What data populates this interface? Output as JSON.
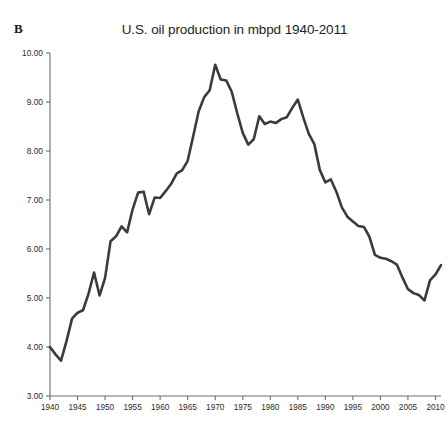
{
  "panel": {
    "label": "B"
  },
  "chart_data": {
    "type": "line",
    "title": "U.S. oil production in mbpd 1940-2011",
    "xlabel": "",
    "ylabel": "",
    "xlim": [
      1940,
      2011
    ],
    "ylim": [
      3.0,
      10.0
    ],
    "grid": false,
    "legend": "none",
    "line_color": "#3b3b3b",
    "axis_color": "#6e6e6e",
    "y_ticks": [
      "3.00",
      "4.00",
      "5.00",
      "6.00",
      "7.00",
      "8.00",
      "9.00",
      "10.00"
    ],
    "y_tick_values": [
      3.0,
      4.0,
      5.0,
      6.0,
      7.0,
      8.0,
      9.0,
      10.0
    ],
    "x_ticks": [
      "1940",
      "1945",
      "1950",
      "1955",
      "1960",
      "1965",
      "1970",
      "1975",
      "1980",
      "1985",
      "1990",
      "1995",
      "2000",
      "2005",
      "2010"
    ],
    "x_tick_values": [
      1940,
      1945,
      1950,
      1955,
      1960,
      1965,
      1970,
      1975,
      1980,
      1985,
      1990,
      1995,
      2000,
      2005,
      2010
    ],
    "x": [
      1940,
      1941,
      1942,
      1943,
      1944,
      1945,
      1946,
      1947,
      1948,
      1949,
      1950,
      1951,
      1952,
      1953,
      1954,
      1955,
      1956,
      1957,
      1958,
      1959,
      1960,
      1961,
      1962,
      1963,
      1964,
      1965,
      1966,
      1967,
      1968,
      1969,
      1970,
      1971,
      1972,
      1973,
      1974,
      1975,
      1976,
      1977,
      1978,
      1979,
      1980,
      1981,
      1982,
      1983,
      1984,
      1985,
      1986,
      1987,
      1988,
      1989,
      1990,
      1991,
      1992,
      1993,
      1994,
      1995,
      1996,
      1997,
      1998,
      1999,
      2000,
      2001,
      2002,
      2003,
      2004,
      2005,
      2006,
      2007,
      2008,
      2009,
      2010,
      2011
    ],
    "values": [
      4.0,
      3.85,
      3.72,
      4.12,
      4.58,
      4.7,
      4.75,
      5.09,
      5.52,
      5.05,
      5.41,
      6.16,
      6.26,
      6.46,
      6.34,
      6.81,
      7.15,
      7.17,
      6.71,
      7.05,
      7.04,
      7.18,
      7.33,
      7.54,
      7.61,
      7.8,
      8.3,
      8.81,
      9.1,
      9.24,
      9.76,
      9.46,
      9.44,
      9.21,
      8.77,
      8.37,
      8.13,
      8.24,
      8.71,
      8.55,
      8.6,
      8.57,
      8.65,
      8.69,
      8.88,
      9.05,
      8.68,
      8.35,
      8.14,
      7.61,
      7.36,
      7.42,
      7.17,
      6.85,
      6.66,
      6.56,
      6.47,
      6.45,
      6.25,
      5.88,
      5.82,
      5.8,
      5.75,
      5.68,
      5.42,
      5.18,
      5.1,
      5.06,
      4.95,
      5.36,
      5.48,
      5.67
    ],
    "peaks": [
      {
        "year": 1970,
        "value": 9.76,
        "note": "historic peak"
      },
      {
        "year": 1985,
        "value": 9.05,
        "note": "secondary peak"
      }
    ],
    "troughs": [
      {
        "year": 1942,
        "value": 3.72
      },
      {
        "year": 1976,
        "value": 8.13
      },
      {
        "year": 2008,
        "value": 4.95
      }
    ]
  },
  "geometry": {
    "plot_left": 50,
    "plot_right": 441,
    "plot_top": 53,
    "plot_bottom": 396
  }
}
